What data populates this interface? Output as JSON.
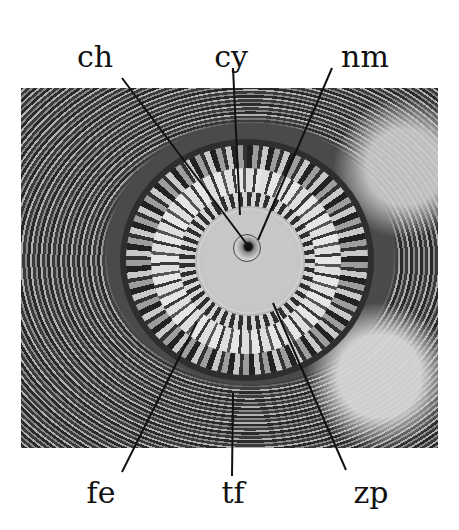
{
  "figure": {
    "labels_top": [
      {
        "id": "ch",
        "text": "ch",
        "x": 95,
        "y": 42
      },
      {
        "id": "cy",
        "text": "cy",
        "x": 231,
        "y": 42
      },
      {
        "id": "nm",
        "text": "nm",
        "x": 365,
        "y": 42
      }
    ],
    "labels_bottom": [
      {
        "id": "fe",
        "text": "fe",
        "x": 101,
        "y": 478
      },
      {
        "id": "tf",
        "text": "tf",
        "x": 233,
        "y": 478
      },
      {
        "id": "zp",
        "text": "zp",
        "x": 371,
        "y": 478
      }
    ],
    "leader_lines": [
      {
        "label": "ch",
        "x1": 122,
        "y1": 78,
        "x2": 249,
        "y2": 247
      },
      {
        "label": "cy",
        "x1": 233,
        "y1": 68,
        "x2": 240,
        "y2": 215
      },
      {
        "label": "nm",
        "x1": 332,
        "y1": 68,
        "x2": 258,
        "y2": 240
      },
      {
        "label": "fe",
        "x1": 122,
        "y1": 472,
        "x2": 197,
        "y2": 322
      },
      {
        "label": "tf",
        "x1": 232,
        "y1": 476,
        "x2": 233,
        "y2": 393
      },
      {
        "label": "zp",
        "x1": 346,
        "y1": 470,
        "x2": 273,
        "y2": 303
      }
    ],
    "colors": {
      "background": "#ffffff",
      "label_text": "#111111",
      "leader_line": "#111111"
    }
  }
}
